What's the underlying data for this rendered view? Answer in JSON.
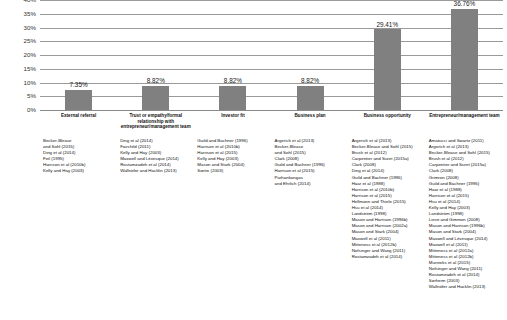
{
  "chart_data": {
    "type": "bar",
    "title": "",
    "xlabel": "",
    "ylabel": "",
    "ylim": [
      0,
      40
    ],
    "ytick_labels": [
      "40%",
      "35%",
      "30%",
      "25%",
      "20%",
      "15%",
      "10%",
      "5%",
      "0%"
    ],
    "ytick_values": [
      40,
      35,
      30,
      25,
      20,
      15,
      10,
      5,
      0
    ],
    "grid": true,
    "legend": "none",
    "bar_color": "#808080",
    "categories": [
      "External referral",
      "Trust or empathy/formal relationship with entrepreneur/management team",
      "Investor fit",
      "Business plan",
      "Business opportunity",
      "Entrepreneur/management team"
    ],
    "values": [
      7.35,
      8.82,
      8.82,
      8.82,
      29.41,
      36.76
    ],
    "data_labels": [
      "7.35%",
      "8.82%",
      "8.82%",
      "8.82%",
      "29.41%",
      "36.76%"
    ]
  },
  "references": {
    "columns": [
      {
        "category": "External referral",
        "items": [
          "Becker-Blease",
          "and Sohl (2015)",
          "Ding et al (2014)",
          "Feil (1995)",
          "Harrison et al (2010b)",
          "Kelly and Hay (2003)"
        ]
      },
      {
        "category": "Trust or empathy/formal relationship with entrepreneur/management team",
        "items": [
          "Ding et al (2014)",
          "Fairchild (2011)",
          "Kelly and Hay (2003)",
          "Maxwell and Lévesque (2014)",
          "Rostamzadeh et al (2014)",
          "Wallnöfer and Hacklin (2013)"
        ]
      },
      {
        "category": "Investor fit",
        "items": [
          "Guild and Bachner (1996)",
          "Harrison et al (2010b)",
          "Harrison et al (2015)",
          "Kelly and Hay (2003)",
          "Mason and Stark (2004)",
          "Sætre (2003)"
        ]
      },
      {
        "category": "Business plan",
        "items": [
          "Argerich et al (2013)",
          "Becker-Blease",
          "and Sohl (2015)",
          "Clark (2008)",
          "Guild and Bachner (1996)",
          "Harrison et al (2015)",
          "Parhankangas",
          "and Ehrlich (2014)"
        ]
      },
      {
        "category": "Business opportunity",
        "items": [
          "Argerich et al (2013)",
          "Becker-Blease and Sohl (2015)",
          "Brush et al (2012)",
          "Carpentier and Suret (2015a)",
          "Clark (2008)",
          "Ding et al (2014)",
          "Guild and Bachner (1996)",
          "Haar et al (1988)",
          "Harrison et al (2010b)",
          "Harrison et al (2015)",
          "Hellmann and Thiele (2015)",
          "Hsu et al (2014)",
          "Landström (1998)",
          "Mason and Harrison (1996b)",
          "Mason and Harrison (2002a)",
          "Mason and Stark (2004)",
          "Maxwell et al (2011)",
          "Mitteness et al (2012b)",
          "Nofsinger and Wang (2011)",
          "Rostamzadeh et al (2014)"
        ]
      },
      {
        "category": "Entrepreneur/management team",
        "items": [
          "Amatucci and Swartz (2011)",
          "Argerich et al (2013)",
          "Becker-Blease and Sohl (2015)",
          "Brush et al (2012)",
          "Carpentier and Suret (2015a)",
          "Clark (2008)",
          "Grimron (2008)",
          "Guild and Bachner (1996)",
          "Haar et al (1988)",
          "Harrison et al (2015)",
          "Hsu et al (2014)",
          "Kelly and Hay (2003)",
          "Landström (1998)",
          "Lieve and Gimmon (2008)",
          "Mason and Harrison (1996b)",
          "Mason and Stark (2004)",
          "Maxwell and Lévesque (2014)",
          "Maxwell et al (2011)",
          "Mitteness et al (2012a)",
          "Mitteness et al (2012b)",
          "Murnieks et al (2015)",
          "Nofsinger and Wang (2011)",
          "Rostamzadeh et al (2014)",
          "Sørheim (2003)",
          "Wallnöfer and Hacklin (2013)"
        ]
      }
    ]
  }
}
